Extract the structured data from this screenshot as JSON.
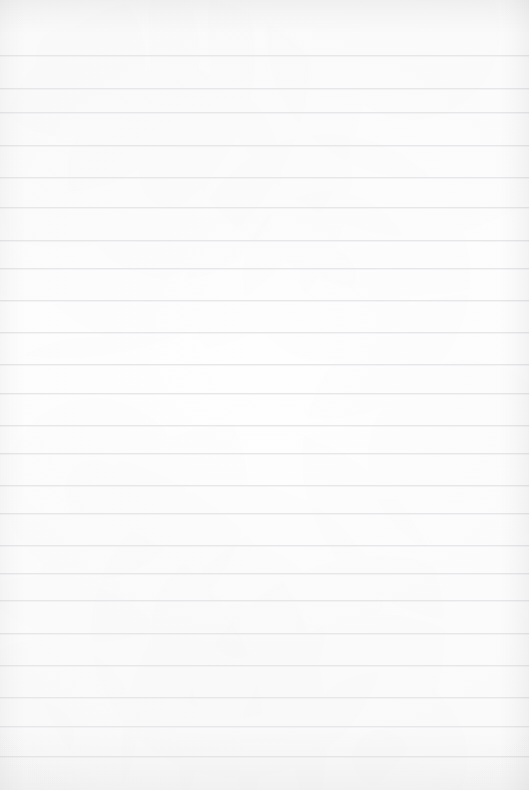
{
  "document": {
    "kind": "ruled-paper-sheet",
    "title": "Blank Ruled Paper",
    "content_text": "",
    "has_text": false,
    "has_handwriting": false,
    "has_margin_line": false,
    "width_px": 529,
    "height_px": 790
  },
  "paper": {
    "background_color": "#fdfdfd",
    "base_tone_center": "#fefefe",
    "base_tone_edge": "#f8f8f9"
  },
  "ruling": {
    "line_color": "#e6e7e9",
    "line_thickness_px": 1,
    "line_spacing_px": 32,
    "first_line_y": 55,
    "line_count": 23,
    "spans_full_width": true,
    "line_positions": [
      55,
      88,
      112,
      145,
      177,
      207,
      240,
      268,
      300,
      332,
      364,
      393,
      425,
      453,
      485,
      513,
      545,
      573,
      600,
      633,
      665,
      697,
      726,
      756
    ]
  },
  "shading": {
    "top_band_opacity": 0.045,
    "bottom_band_opacity": 0.03,
    "left_band_opacity": 0.028,
    "right_band_opacity": 0.04,
    "vignette_opacity": 0.035
  }
}
